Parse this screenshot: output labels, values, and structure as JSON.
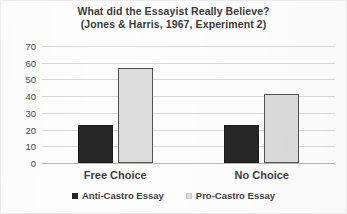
{
  "chart_data": {
    "type": "bar",
    "title": "What did the Essayist Really Believe?",
    "subtitle": "(Jones & Harris, 1967, Experiment 2)",
    "title_lines": [
      "What did the Essayist Really Believe?",
      "(Jones & Harris, 1967, Experiment 2)"
    ],
    "xlabel": "",
    "ylabel": "",
    "ylim": [
      0,
      70
    ],
    "ytick_step": 10,
    "yticks": [
      70,
      60,
      50,
      40,
      30,
      20,
      10,
      0
    ],
    "grid": true,
    "legend_position": "bottom",
    "categories": [
      "Free Choice",
      "No Choice"
    ],
    "series": [
      {
        "name": "Anti-Castro Essay",
        "color": "#262626",
        "values": [
          23,
          23
        ]
      },
      {
        "name": "Pro-Castro Essay",
        "color": "#dcdcdc",
        "values": [
          57,
          41
        ]
      }
    ]
  },
  "legend": {
    "items": [
      {
        "label": "Anti-Castro Essay",
        "swatch": "dark-square-swatch"
      },
      {
        "label": "Pro-Castro Essay",
        "swatch": "light-square-swatch"
      }
    ]
  }
}
